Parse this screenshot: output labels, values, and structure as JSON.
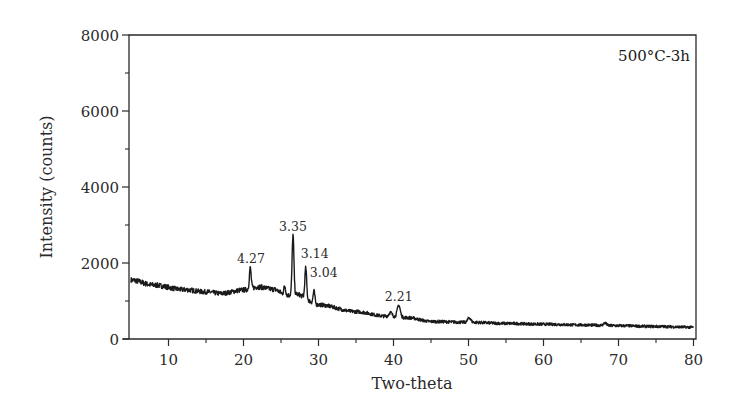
{
  "chart_data": {
    "type": "line",
    "title": "",
    "annotation": "500°C-3h",
    "xlabel": "Two-theta",
    "ylabel": "Intensity (counts)",
    "xlim": [
      5,
      80
    ],
    "ylim": [
      0,
      8000
    ],
    "x_ticks": [
      10,
      20,
      30,
      40,
      50,
      60,
      70,
      80
    ],
    "x_minor_ticks": [
      15,
      25,
      35,
      45,
      55,
      65,
      75
    ],
    "y_ticks": [
      0,
      2000,
      4000,
      6000,
      8000
    ],
    "y_minor_ticks": [
      1000,
      3000,
      5000,
      7000
    ],
    "grid": false,
    "legend": null,
    "line_color": "#1a1a1a",
    "baseline": {
      "x": [
        5,
        8,
        12,
        15,
        17,
        20,
        22,
        24,
        25.8,
        27,
        30,
        35,
        39,
        42,
        45,
        50,
        55,
        60,
        65,
        70,
        75,
        80
      ],
      "y": [
        1550,
        1420,
        1300,
        1240,
        1200,
        1290,
        1370,
        1310,
        1150,
        1180,
        900,
        720,
        600,
        560,
        460,
        440,
        410,
        390,
        370,
        350,
        330,
        310
      ]
    },
    "peaks": [
      {
        "two_theta": 20.9,
        "intensity": 1870,
        "label": "4.27"
      },
      {
        "two_theta": 25.5,
        "intensity": 1400,
        "label": ""
      },
      {
        "two_theta": 26.6,
        "intensity": 2740,
        "label": "3.35"
      },
      {
        "two_theta": 28.3,
        "intensity": 1870,
        "label": "3.14"
      },
      {
        "two_theta": 29.4,
        "intensity": 1260,
        "label": "3.04"
      },
      {
        "two_theta": 39.6,
        "intensity": 700,
        "label": ""
      },
      {
        "two_theta": 40.7,
        "intensity": 890,
        "label": "2.21"
      },
      {
        "two_theta": 50.1,
        "intensity": 560,
        "label": ""
      },
      {
        "two_theta": 68.2,
        "intensity": 420,
        "label": ""
      }
    ],
    "peak_labels": [
      {
        "text": "4.27",
        "x": 21.0,
        "y": 2000
      },
      {
        "text": "3.35",
        "x": 26.6,
        "y": 2830
      },
      {
        "text": "3.14",
        "x": 29.5,
        "y": 2140
      },
      {
        "text": "3.04",
        "x": 30.7,
        "y": 1620
      },
      {
        "text": "2.21",
        "x": 40.7,
        "y": 1000
      }
    ]
  }
}
